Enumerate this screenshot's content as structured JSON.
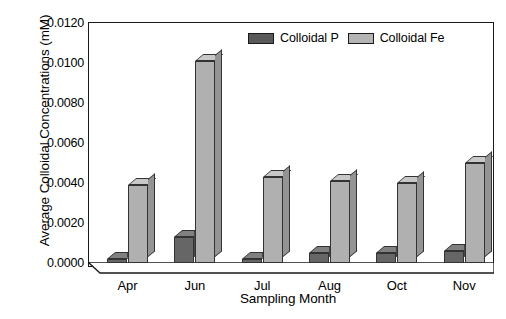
{
  "chart_data": {
    "type": "bar",
    "title": "",
    "xlabel": "Sampling Month",
    "ylabel": "Average Colloidal Concentrations (mM)",
    "categories": [
      "Apr",
      "Jun",
      "Jul",
      "Aug",
      "Oct",
      "Nov"
    ],
    "series": [
      {
        "name": "Colloidal P",
        "color": "#666666",
        "values": [
          0.0002,
          0.0013,
          0.0002,
          0.0005,
          0.0005,
          0.0006
        ]
      },
      {
        "name": "Colloidal Fe",
        "color": "#b0b0b0",
        "values": [
          0.0039,
          0.0101,
          0.0043,
          0.0041,
          0.004,
          0.005
        ]
      }
    ],
    "ylim": [
      0.0,
      0.012
    ],
    "ytick_labels": [
      "0.0000",
      "0.0020",
      "0.0040",
      "0.0060",
      "0.0080",
      "0.0100",
      "0.0120"
    ],
    "ytick_values": [
      0.0,
      0.002,
      0.004,
      0.006,
      0.008,
      0.01,
      0.012
    ],
    "grid": false,
    "legend_position": "top-center",
    "style": "3d-bars"
  },
  "legend": {
    "entries": [
      {
        "label": "Colloidal P"
      },
      {
        "label": "Colloidal Fe"
      }
    ]
  }
}
